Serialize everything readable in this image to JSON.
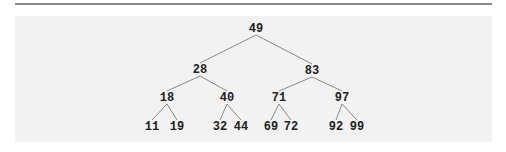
{
  "diagram": {
    "type": "binary-search-tree",
    "nodes": [
      {
        "id": "n49",
        "label": "49",
        "x": 256,
        "y": 29
      },
      {
        "id": "n28",
        "label": "28",
        "x": 200,
        "y": 70
      },
      {
        "id": "n83",
        "label": "83",
        "x": 312,
        "y": 71
      },
      {
        "id": "n18",
        "label": "18",
        "x": 167,
        "y": 98
      },
      {
        "id": "n40",
        "label": "40",
        "x": 227,
        "y": 98
      },
      {
        "id": "n71",
        "label": "71",
        "x": 279,
        "y": 98
      },
      {
        "id": "n97",
        "label": "97",
        "x": 342,
        "y": 98
      },
      {
        "id": "n11",
        "label": "11",
        "x": 152,
        "y": 127
      },
      {
        "id": "n19",
        "label": "19",
        "x": 177,
        "y": 127
      },
      {
        "id": "n32",
        "label": "32",
        "x": 220,
        "y": 127
      },
      {
        "id": "n44",
        "label": "44",
        "x": 241,
        "y": 127
      },
      {
        "id": "n69",
        "label": "69",
        "x": 271,
        "y": 127
      },
      {
        "id": "n72",
        "label": "72",
        "x": 291,
        "y": 127
      },
      {
        "id": "n92",
        "label": "92",
        "x": 336,
        "y": 127
      },
      {
        "id": "n99",
        "label": "99",
        "x": 357,
        "y": 127
      }
    ],
    "edges": [
      [
        "n49",
        "n28"
      ],
      [
        "n49",
        "n83"
      ],
      [
        "n28",
        "n18"
      ],
      [
        "n28",
        "n40"
      ],
      [
        "n83",
        "n71"
      ],
      [
        "n83",
        "n97"
      ],
      [
        "n18",
        "n11"
      ],
      [
        "n18",
        "n19"
      ],
      [
        "n40",
        "n32"
      ],
      [
        "n40",
        "n44"
      ],
      [
        "n71",
        "n69"
      ],
      [
        "n71",
        "n72"
      ],
      [
        "n97",
        "n92"
      ],
      [
        "n97",
        "n99"
      ]
    ]
  }
}
